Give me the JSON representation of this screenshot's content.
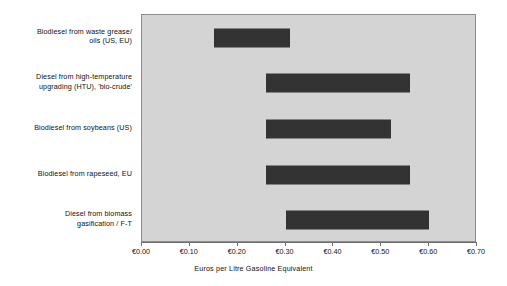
{
  "chart_data": {
    "type": "bar",
    "orientation": "horizontal",
    "range_bars": true,
    "title": "",
    "xlabel": "Euros per Litre Gasoline Equivalent",
    "ylabel": "",
    "xlim": [
      0.0,
      0.7
    ],
    "xtick_values": [
      0.0,
      0.1,
      0.2,
      0.3,
      0.4,
      0.5,
      0.6,
      0.7
    ],
    "xtick_labels": [
      "€0.00",
      "€0.10",
      "€0.20",
      "€0.30",
      "€0.40",
      "€0.50",
      "€0.60",
      "€0.70"
    ],
    "grid": false,
    "legend": null,
    "plot_background": "#d4d4d4",
    "bar_color": "#333333",
    "categories": [
      "Biodiesel from waste grease/ oils (US, EU)",
      "Diesel from high-temperature upgrading (HTU), 'bio-crude'",
      "Biodiesel from soybeans (US)",
      "Biodiesel from rapeseed, EU",
      "Diesel from biomass gasification / F-T"
    ],
    "bars": [
      {
        "label_line1": "Biodiesel from waste grease/",
        "label_line2": "oils (US, EU)",
        "low": 0.15,
        "high": 0.31
      },
      {
        "label_line1": "Diesel from high-temperature",
        "label_line2": "upgrading (HTU), 'bio-crude'",
        "low": 0.26,
        "high": 0.56
      },
      {
        "label_line1": "Biodiesel from soybeans (US)",
        "label_line2": "",
        "low": 0.26,
        "high": 0.52
      },
      {
        "label_line1": "Biodiesel from rapeseed, EU",
        "label_line2": "",
        "low": 0.26,
        "high": 0.56
      },
      {
        "label_line1": "Diesel from biomass",
        "label_line2": "gasification / F-T",
        "low": 0.3,
        "high": 0.6
      }
    ]
  }
}
